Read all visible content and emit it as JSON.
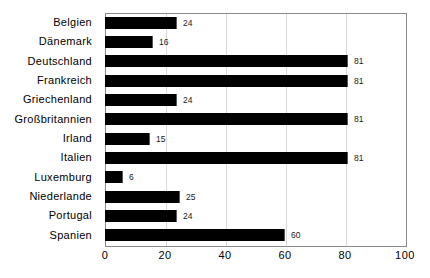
{
  "chart_data": {
    "type": "bar",
    "orientation": "horizontal",
    "title": "",
    "subtitle": "",
    "xlabel": "",
    "ylabel": "",
    "xlim": [
      0,
      100
    ],
    "xticks": [
      0,
      20,
      40,
      60,
      80,
      100
    ],
    "xtick_labels": [
      "0",
      "20",
      "40",
      "60",
      "80",
      "100"
    ],
    "grid": true,
    "legend": false,
    "bar_color": "#000000",
    "frame_color": "#8a8a8a",
    "gridline_color": "#d9d9d9",
    "categories": [
      "Belgien",
      "Dänemark",
      "Deutschland",
      "Frankreich",
      "Griechenland",
      "Großbritannien",
      "Irland",
      "Italien",
      "Luxemburg",
      "Niederlande",
      "Portugal",
      "Spanien"
    ],
    "values": [
      24,
      16,
      81,
      81,
      24,
      81,
      15,
      81,
      6,
      25,
      24,
      60
    ],
    "data_labels": [
      "24",
      "16",
      "81",
      "81",
      "24",
      "81",
      "15",
      "81",
      "6",
      "25",
      "24",
      "60"
    ]
  }
}
